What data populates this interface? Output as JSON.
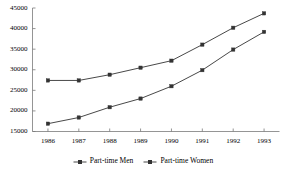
{
  "chart_data": {
    "type": "line",
    "title": "",
    "xlabel": "",
    "ylabel": "",
    "categories": [
      "1986",
      "1987",
      "1988",
      "1989",
      "1990",
      "1991",
      "1992",
      "1993"
    ],
    "ylim": [
      15000,
      45000
    ],
    "yticks": [
      15000,
      20000,
      25000,
      30000,
      35000,
      40000,
      45000
    ],
    "ytick_labels": [
      "15000",
      "20000",
      "25000",
      "30000",
      "35000",
      "40000",
      "45000"
    ],
    "grid": false,
    "legend_position": "bottom-center",
    "series": [
      {
        "name": "Part-time Men",
        "marker": "square",
        "color": "#333333",
        "values": [
          16900,
          18400,
          20900,
          23000,
          26000,
          29900,
          34900,
          39200
        ]
      },
      {
        "name": "Part-time Women",
        "marker": "square",
        "color": "#333333",
        "values": [
          27400,
          27400,
          28800,
          30500,
          32200,
          36100,
          40200,
          43700
        ]
      }
    ]
  },
  "legend": {
    "items": [
      {
        "label": "Part-time Men",
        "marker_name": "legend-marker-part-time-men"
      },
      {
        "label": "Part-time Women",
        "marker_name": "legend-marker-part-time-women"
      }
    ]
  },
  "colors": {
    "axis": "#7a7a7a",
    "series_men": "#333333",
    "series_women": "#444444",
    "background": "#ffffff"
  }
}
